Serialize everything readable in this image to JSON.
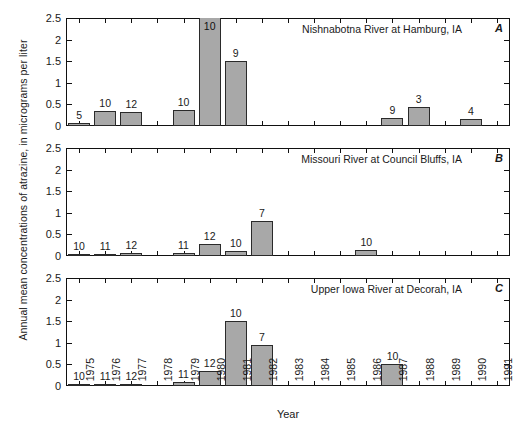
{
  "chart_data": {
    "type": "bar",
    "title": "",
    "xlabel": "Year",
    "ylabel": "Annual mean concentrations of atrazine, in micrograms per liter",
    "x": [
      1975,
      1976,
      1977,
      1978,
      1979,
      1980,
      1981,
      1982,
      1983,
      1984,
      1985,
      1986,
      1987,
      1988,
      1989,
      1990,
      1991
    ],
    "xtick_labels": [
      "1975",
      "1976",
      "1977",
      "1978",
      "1979",
      "1980",
      "1981",
      "1982",
      "1983",
      "1984",
      "1985",
      "1986",
      "1987",
      "1988",
      "1989",
      "1990",
      "1991"
    ],
    "ylim": [
      0,
      2.5
    ],
    "ytick_labels": [
      "0",
      "0.5",
      "1",
      "1.5",
      "2",
      "2.5"
    ],
    "ytick_values": [
      0,
      0.5,
      1,
      1.5,
      2,
      2.5
    ],
    "grid": false,
    "legend": "none",
    "bar_color": "#a8a8a8",
    "bar_edge_color": "#2a2a2a",
    "note": "Numbers above each bar are the count of samples used for that annual mean.",
    "panels": [
      {
        "letter": "A",
        "title": "Nishnabotna River at Hamburg, IA",
        "categories": [
          1975,
          1976,
          1977,
          1979,
          1980,
          1981,
          1987,
          1988,
          1990
        ],
        "values": [
          0.06,
          0.35,
          0.32,
          0.36,
          2.5,
          1.5,
          0.18,
          0.44,
          0.17
        ],
        "sample_counts": [
          5,
          10,
          12,
          10,
          10,
          9,
          9,
          3,
          4
        ],
        "clipped": [
          false,
          false,
          false,
          false,
          true,
          false,
          false,
          false,
          false
        ]
      },
      {
        "letter": "B",
        "title": "Missouri River at Council Bluffs, IA",
        "categories": [
          1975,
          1976,
          1977,
          1979,
          1980,
          1981,
          1982,
          1986
        ],
        "values": [
          0.05,
          0.05,
          0.06,
          0.07,
          0.28,
          0.11,
          0.82,
          0.15
        ],
        "sample_counts": [
          10,
          11,
          12,
          11,
          12,
          10,
          7,
          10
        ],
        "clipped": [
          false,
          false,
          false,
          false,
          false,
          false,
          false,
          false
        ]
      },
      {
        "letter": "C",
        "title": "Upper Iowa River at Decorah, IA",
        "categories": [
          1975,
          1976,
          1977,
          1979,
          1980,
          1981,
          1982,
          1987
        ],
        "values": [
          0.04,
          0.04,
          0.05,
          0.09,
          0.34,
          1.5,
          0.95,
          0.51
        ],
        "sample_counts": [
          10,
          11,
          12,
          11,
          12,
          10,
          7,
          10
        ],
        "clipped": [
          false,
          false,
          false,
          false,
          false,
          false,
          false,
          false
        ]
      }
    ]
  }
}
